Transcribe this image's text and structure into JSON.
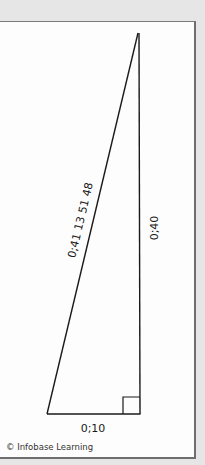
{
  "figure": {
    "type": "right-triangle",
    "vertices": {
      "top": [
        138,
        33
      ],
      "bottom_left": [
        47,
        414
      ],
      "bottom_right": [
        140,
        414
      ]
    },
    "right_angle_marker": {
      "x": 123,
      "y": 397,
      "size": 17
    },
    "labels": {
      "hypotenuse": "0;41 13 51 48",
      "vertical_side": "0;40",
      "base": "0;10"
    },
    "line_color": "#1a1a1a"
  },
  "credit": "© Infobase Learning",
  "colors": {
    "background": "#e6e6e6",
    "panel": "#fdfdfd",
    "panel_border": "#7a7a7a"
  }
}
